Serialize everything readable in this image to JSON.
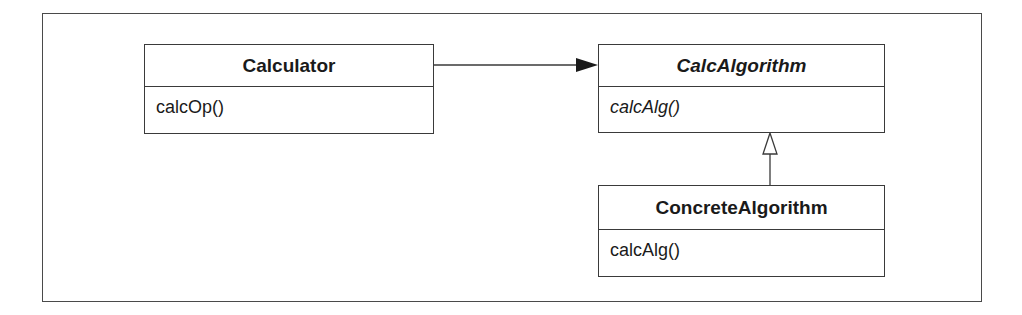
{
  "diagram": {
    "type": "UML class diagram",
    "classes": [
      {
        "name": "Calculator",
        "abstract": false,
        "operations": [
          "calcOp()"
        ]
      },
      {
        "name": "CalcAlgorithm",
        "abstract": true,
        "operations": [
          "calcAlg()"
        ]
      },
      {
        "name": "ConcreteAlgorithm",
        "abstract": false,
        "operations": [
          "calcAlg()"
        ]
      }
    ],
    "relations": [
      {
        "from": "Calculator",
        "to": "CalcAlgorithm",
        "kind": "association",
        "arrow": "filled"
      },
      {
        "from": "ConcreteAlgorithm",
        "to": "CalcAlgorithm",
        "kind": "generalization",
        "arrow": "hollow-triangle"
      }
    ]
  },
  "colors": {
    "line": "#3a3a3a",
    "frame": "#4a4a4a",
    "background": "#ffffff"
  }
}
